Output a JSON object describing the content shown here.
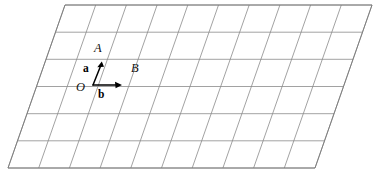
{
  "figure": {
    "background_color": "#ffffff",
    "grid_line_color": "#8a8a8a",
    "vector_color": "#000000",
    "columns": 10,
    "rows": 6,
    "parallelogram_corners": {
      "top_left": [
        65,
        5
      ],
      "top_right": [
        372,
        5
      ],
      "bottom_right": [
        305,
        168
      ],
      "bottom_left": [
        8,
        168
      ]
    },
    "labels": {
      "origin": "O",
      "point_a": "A",
      "point_b": "B",
      "vector_a": "a",
      "vector_b": "b"
    },
    "vectors": [
      {
        "name": "a",
        "from": [
          93,
          85
        ],
        "to": [
          101,
          63
        ],
        "label": "a",
        "endpoint_label": "A"
      },
      {
        "name": "b",
        "from": [
          93,
          85
        ],
        "to": [
          121,
          85
        ],
        "label": "b",
        "endpoint_label": "B"
      }
    ]
  }
}
